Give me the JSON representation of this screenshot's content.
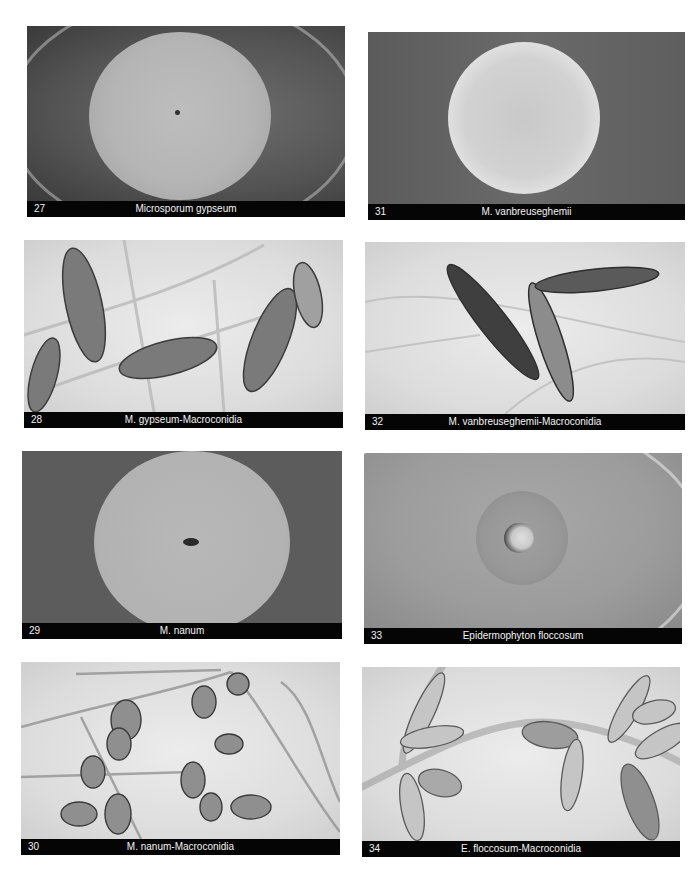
{
  "plates": [
    {
      "number": "27",
      "title": "Microsporum gypseum",
      "kind": "colony"
    },
    {
      "number": "28",
      "title": "M. gypseum-Macroconidia",
      "kind": "micrograph"
    },
    {
      "number": "29",
      "title": "M. nanum",
      "kind": "colony"
    },
    {
      "number": "30",
      "title": "M. nanum-Macroconidia",
      "kind": "micrograph"
    },
    {
      "number": "31",
      "title": "M. vanbreuseghemii",
      "kind": "colony"
    },
    {
      "number": "32",
      "title": "M. vanbreuseghemii-Macroconidia",
      "kind": "micrograph"
    },
    {
      "number": "33",
      "title": "Epidermophyton floccosum",
      "kind": "colony"
    },
    {
      "number": "34",
      "title": "E. floccosum-Macroconidia",
      "kind": "micrograph"
    }
  ]
}
